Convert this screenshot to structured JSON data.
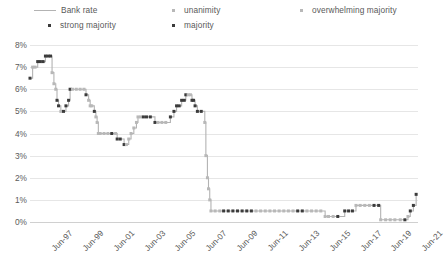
{
  "legend": {
    "items": [
      {
        "key": "bank_rate",
        "label": "Bank rate",
        "marker": "line",
        "color": "#b3b3b3"
      },
      {
        "key": "strong_majority",
        "label": "strong majority",
        "marker": "dot",
        "color": "#3b3b3b"
      },
      {
        "key": "unanimity",
        "label": "unanimity",
        "marker": "dot",
        "color": "#b8b8b8"
      },
      {
        "key": "majority",
        "label": "majority",
        "marker": "dot",
        "color": "#3b3b3b"
      },
      {
        "key": "overwhelming_majority",
        "label": "overwhelming majority",
        "marker": "dot",
        "color": "#b8b8b8"
      }
    ]
  },
  "axes": {
    "y_ticks": [
      "0%",
      "1%",
      "2%",
      "3%",
      "4%",
      "5%",
      "6%",
      "7%",
      "8%"
    ],
    "x_ticks": [
      "Jun-97",
      "Jun-99",
      "Jun-01",
      "Jun-03",
      "Jun-05",
      "Jun-07",
      "Jun-09",
      "Jun-11",
      "Jun-13",
      "Jun-15",
      "Jun-17",
      "Jun-19",
      "Jun-21"
    ]
  },
  "chart_data": {
    "type": "line",
    "title": "",
    "xlabel": "",
    "ylabel": "",
    "ylim": [
      0,
      8
    ],
    "xlim": [
      1997.45,
      2022.6
    ],
    "grid": true,
    "legend_position": "top",
    "y_tick_values": [
      0,
      1,
      2,
      3,
      4,
      5,
      6,
      7,
      8
    ],
    "y_tick_labels": [
      "0%",
      "1%",
      "2%",
      "3%",
      "4%",
      "5%",
      "6%",
      "7%",
      "8%"
    ],
    "x_tick_values": [
      1997.45,
      1999.45,
      2001.45,
      2003.45,
      2005.45,
      2007.45,
      2009.45,
      2011.45,
      2013.45,
      2015.45,
      2017.45,
      2019.45,
      2021.45
    ],
    "x_tick_labels": [
      "Jun-97",
      "Jun-99",
      "Jun-01",
      "Jun-03",
      "Jun-05",
      "Jun-07",
      "Jun-09",
      "Jun-11",
      "Jun-13",
      "Jun-15",
      "Jun-17",
      "Jun-19",
      "Jun-21"
    ],
    "series": [
      {
        "name": "Bank rate",
        "line_color": "#b3b3b3",
        "marker_categories": [
          "strong majority",
          "unanimity",
          "majority",
          "overwhelming majority"
        ],
        "category_colors": {
          "strong majority": "#3b3b3b",
          "majority": "#3b3b3b",
          "unanimity": "#b8b8b8",
          "overwhelming majority": "#b8b8b8"
        },
        "points": [
          {
            "x": 1997.45,
            "y": 6.5,
            "vote": "majority"
          },
          {
            "x": 1997.62,
            "y": 7.0,
            "vote": "unanimity"
          },
          {
            "x": 1997.78,
            "y": 7.0,
            "vote": "unanimity"
          },
          {
            "x": 1997.95,
            "y": 7.25,
            "vote": "strong majority"
          },
          {
            "x": 1998.12,
            "y": 7.25,
            "vote": "majority"
          },
          {
            "x": 1998.3,
            "y": 7.25,
            "vote": "strong majority"
          },
          {
            "x": 1998.45,
            "y": 7.5,
            "vote": "strong majority"
          },
          {
            "x": 1998.62,
            "y": 7.5,
            "vote": "majority"
          },
          {
            "x": 1998.78,
            "y": 7.5,
            "vote": "strong majority"
          },
          {
            "x": 1998.88,
            "y": 6.75,
            "vote": "unanimity"
          },
          {
            "x": 1999.0,
            "y": 6.25,
            "vote": "unanimity"
          },
          {
            "x": 1999.12,
            "y": 6.0,
            "vote": "unanimity"
          },
          {
            "x": 1999.2,
            "y": 5.5,
            "vote": "majority"
          },
          {
            "x": 1999.3,
            "y": 5.25,
            "vote": "strong majority"
          },
          {
            "x": 1999.45,
            "y": 5.0,
            "vote": "unanimity"
          },
          {
            "x": 1999.62,
            "y": 5.0,
            "vote": "majority"
          },
          {
            "x": 1999.78,
            "y": 5.25,
            "vote": "strong majority"
          },
          {
            "x": 1999.95,
            "y": 5.5,
            "vote": "strong majority"
          },
          {
            "x": 2000.05,
            "y": 6.0,
            "vote": "majority"
          },
          {
            "x": 2000.2,
            "y": 6.0,
            "vote": "unanimity"
          },
          {
            "x": 2000.45,
            "y": 6.0,
            "vote": "unanimity"
          },
          {
            "x": 2000.7,
            "y": 6.0,
            "vote": "unanimity"
          },
          {
            "x": 2000.95,
            "y": 6.0,
            "vote": "unanimity"
          },
          {
            "x": 2001.08,
            "y": 5.75,
            "vote": "strong majority"
          },
          {
            "x": 2001.25,
            "y": 5.5,
            "vote": "unanimity"
          },
          {
            "x": 2001.35,
            "y": 5.25,
            "vote": "unanimity"
          },
          {
            "x": 2001.45,
            "y": 5.25,
            "vote": "unanimity"
          },
          {
            "x": 2001.62,
            "y": 5.0,
            "vote": "majority"
          },
          {
            "x": 2001.72,
            "y": 4.75,
            "vote": "unanimity"
          },
          {
            "x": 2001.8,
            "y": 4.5,
            "vote": "unanimity"
          },
          {
            "x": 2001.88,
            "y": 4.0,
            "vote": "unanimity"
          },
          {
            "x": 2002.0,
            "y": 4.0,
            "vote": "unanimity"
          },
          {
            "x": 2002.25,
            "y": 4.0,
            "vote": "unanimity"
          },
          {
            "x": 2002.5,
            "y": 4.0,
            "vote": "unanimity"
          },
          {
            "x": 2002.75,
            "y": 4.0,
            "vote": "strong majority"
          },
          {
            "x": 2003.0,
            "y": 4.0,
            "vote": "unanimity"
          },
          {
            "x": 2003.1,
            "y": 3.75,
            "vote": "majority"
          },
          {
            "x": 2003.3,
            "y": 3.75,
            "vote": "strong majority"
          },
          {
            "x": 2003.55,
            "y": 3.5,
            "vote": "majority"
          },
          {
            "x": 2003.7,
            "y": 3.5,
            "vote": "unanimity"
          },
          {
            "x": 2003.85,
            "y": 3.75,
            "vote": "unanimity"
          },
          {
            "x": 2004.0,
            "y": 4.0,
            "vote": "unanimity"
          },
          {
            "x": 2004.18,
            "y": 4.25,
            "vote": "unanimity"
          },
          {
            "x": 2004.35,
            "y": 4.5,
            "vote": "unanimity"
          },
          {
            "x": 2004.45,
            "y": 4.75,
            "vote": "unanimity"
          },
          {
            "x": 2004.62,
            "y": 4.75,
            "vote": "unanimity"
          },
          {
            "x": 2004.8,
            "y": 4.75,
            "vote": "strong majority"
          },
          {
            "x": 2005.0,
            "y": 4.75,
            "vote": "strong majority"
          },
          {
            "x": 2005.25,
            "y": 4.75,
            "vote": "strong majority"
          },
          {
            "x": 2005.55,
            "y": 4.5,
            "vote": "majority"
          },
          {
            "x": 2005.75,
            "y": 4.5,
            "vote": "unanimity"
          },
          {
            "x": 2006.0,
            "y": 4.5,
            "vote": "unanimity"
          },
          {
            "x": 2006.25,
            "y": 4.5,
            "vote": "unanimity"
          },
          {
            "x": 2006.55,
            "y": 4.75,
            "vote": "strong majority"
          },
          {
            "x": 2006.78,
            "y": 5.0,
            "vote": "strong majority"
          },
          {
            "x": 2006.95,
            "y": 5.25,
            "vote": "majority"
          },
          {
            "x": 2007.12,
            "y": 5.25,
            "vote": "majority"
          },
          {
            "x": 2007.28,
            "y": 5.5,
            "vote": "majority"
          },
          {
            "x": 2007.45,
            "y": 5.5,
            "vote": "strong majority"
          },
          {
            "x": 2007.55,
            "y": 5.75,
            "vote": "strong majority"
          },
          {
            "x": 2007.7,
            "y": 5.75,
            "vote": "unanimity"
          },
          {
            "x": 2007.85,
            "y": 5.75,
            "vote": "unanimity"
          },
          {
            "x": 2007.95,
            "y": 5.5,
            "vote": "majority"
          },
          {
            "x": 2008.05,
            "y": 5.5,
            "vote": "strong majority"
          },
          {
            "x": 2008.15,
            "y": 5.25,
            "vote": "strong majority"
          },
          {
            "x": 2008.3,
            "y": 5.0,
            "vote": "majority"
          },
          {
            "x": 2008.55,
            "y": 5.0,
            "vote": "majority"
          },
          {
            "x": 2008.78,
            "y": 4.5,
            "vote": "unanimity"
          },
          {
            "x": 2008.85,
            "y": 3.0,
            "vote": "unanimity"
          },
          {
            "x": 2008.95,
            "y": 2.0,
            "vote": "unanimity"
          },
          {
            "x": 2009.02,
            "y": 1.5,
            "vote": "unanimity"
          },
          {
            "x": 2009.1,
            "y": 1.0,
            "vote": "unanimity"
          },
          {
            "x": 2009.18,
            "y": 0.5,
            "vote": "unanimity"
          },
          {
            "x": 2009.45,
            "y": 0.5,
            "vote": "unanimity"
          },
          {
            "x": 2009.75,
            "y": 0.5,
            "vote": "unanimity"
          },
          {
            "x": 2010.0,
            "y": 0.5,
            "vote": "strong majority"
          },
          {
            "x": 2010.3,
            "y": 0.5,
            "vote": "strong majority"
          },
          {
            "x": 2010.6,
            "y": 0.5,
            "vote": "majority"
          },
          {
            "x": 2010.9,
            "y": 0.5,
            "vote": "majority"
          },
          {
            "x": 2011.2,
            "y": 0.5,
            "vote": "majority"
          },
          {
            "x": 2011.5,
            "y": 0.5,
            "vote": "majority"
          },
          {
            "x": 2011.8,
            "y": 0.5,
            "vote": "strong majority"
          },
          {
            "x": 2012.1,
            "y": 0.5,
            "vote": "unanimity"
          },
          {
            "x": 2012.4,
            "y": 0.5,
            "vote": "unanimity"
          },
          {
            "x": 2012.7,
            "y": 0.5,
            "vote": "unanimity"
          },
          {
            "x": 2013.0,
            "y": 0.5,
            "vote": "unanimity"
          },
          {
            "x": 2013.3,
            "y": 0.5,
            "vote": "unanimity"
          },
          {
            "x": 2013.6,
            "y": 0.5,
            "vote": "unanimity"
          },
          {
            "x": 2013.9,
            "y": 0.5,
            "vote": "unanimity"
          },
          {
            "x": 2014.2,
            "y": 0.5,
            "vote": "unanimity"
          },
          {
            "x": 2014.5,
            "y": 0.5,
            "vote": "unanimity"
          },
          {
            "x": 2014.8,
            "y": 0.5,
            "vote": "strong majority"
          },
          {
            "x": 2015.1,
            "y": 0.5,
            "vote": "strong majority"
          },
          {
            "x": 2015.4,
            "y": 0.5,
            "vote": "overwhelming majority"
          },
          {
            "x": 2015.7,
            "y": 0.5,
            "vote": "overwhelming majority"
          },
          {
            "x": 2016.0,
            "y": 0.5,
            "vote": "unanimity"
          },
          {
            "x": 2016.3,
            "y": 0.5,
            "vote": "unanimity"
          },
          {
            "x": 2016.58,
            "y": 0.25,
            "vote": "unanimity"
          },
          {
            "x": 2016.8,
            "y": 0.25,
            "vote": "unanimity"
          },
          {
            "x": 2017.1,
            "y": 0.25,
            "vote": "overwhelming majority"
          },
          {
            "x": 2017.4,
            "y": 0.25,
            "vote": "strong majority"
          },
          {
            "x": 2017.85,
            "y": 0.5,
            "vote": "strong majority"
          },
          {
            "x": 2018.1,
            "y": 0.5,
            "vote": "strong majority"
          },
          {
            "x": 2018.35,
            "y": 0.5,
            "vote": "majority"
          },
          {
            "x": 2018.58,
            "y": 0.75,
            "vote": "unanimity"
          },
          {
            "x": 2018.85,
            "y": 0.75,
            "vote": "unanimity"
          },
          {
            "x": 2019.15,
            "y": 0.75,
            "vote": "unanimity"
          },
          {
            "x": 2019.45,
            "y": 0.75,
            "vote": "unanimity"
          },
          {
            "x": 2019.75,
            "y": 0.75,
            "vote": "strong majority"
          },
          {
            "x": 2020.05,
            "y": 0.75,
            "vote": "strong majority"
          },
          {
            "x": 2020.18,
            "y": 0.1,
            "vote": "unanimity"
          },
          {
            "x": 2020.5,
            "y": 0.1,
            "vote": "unanimity"
          },
          {
            "x": 2020.8,
            "y": 0.1,
            "vote": "unanimity"
          },
          {
            "x": 2021.1,
            "y": 0.1,
            "vote": "unanimity"
          },
          {
            "x": 2021.45,
            "y": 0.1,
            "vote": "unanimity"
          },
          {
            "x": 2021.75,
            "y": 0.1,
            "vote": "strong majority"
          },
          {
            "x": 2021.95,
            "y": 0.25,
            "vote": "overwhelming majority"
          },
          {
            "x": 2022.1,
            "y": 0.5,
            "vote": "strong majority"
          },
          {
            "x": 2022.3,
            "y": 0.75,
            "vote": "strong majority"
          },
          {
            "x": 2022.48,
            "y": 1.25,
            "vote": "strong majority"
          }
        ]
      }
    ]
  }
}
